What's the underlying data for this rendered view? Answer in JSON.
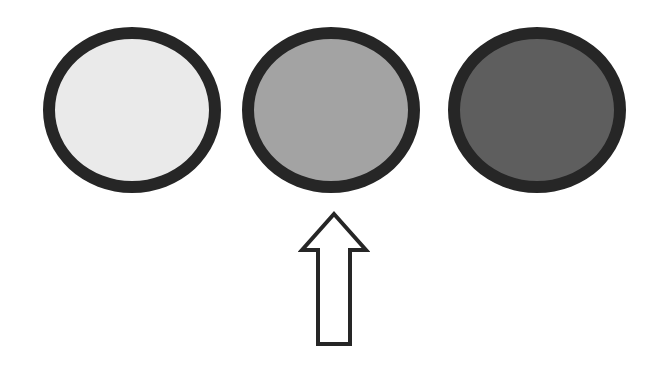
{
  "diagram": {
    "circles": [
      {
        "label": "light",
        "fill": "#eaeaea",
        "border": "#262626"
      },
      {
        "label": "medium",
        "fill": "#a3a3a3",
        "border": "#262626"
      },
      {
        "label": "dark",
        "fill": "#5e5e5e",
        "border": "#262626"
      }
    ],
    "arrow": {
      "direction": "up",
      "target_index": 1,
      "fill": "#ffffff",
      "stroke": "#262626"
    }
  }
}
